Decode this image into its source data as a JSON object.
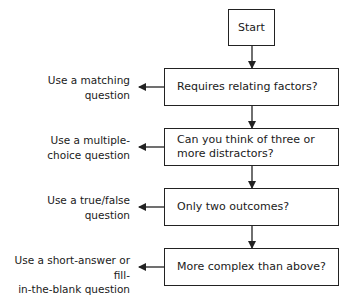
{
  "start": {
    "label": "Start"
  },
  "decisions": [
    {
      "question": "Requires relating factors?",
      "outcome": "Use a matching question"
    },
    {
      "question_lines": [
        "Can you think of three or",
        "more distractors?"
      ],
      "outcome_lines": [
        "Use a multiple-",
        "choice question"
      ]
    },
    {
      "question": "Only two outcomes?",
      "outcome_lines": [
        "Use a true/false",
        "question"
      ]
    },
    {
      "question": "More complex than above?",
      "outcome_lines": [
        "Use a short-answer or fill-",
        "in-the-blank question"
      ]
    }
  ],
  "labels": {
    "d0_outcome_lines": [
      "Use a matching",
      "question"
    ]
  },
  "colors": {
    "line": "#222222",
    "text": "#1a1a1a",
    "background": "#ffffff"
  }
}
